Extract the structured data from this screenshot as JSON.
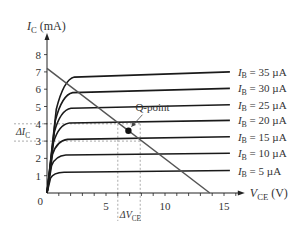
{
  "chart_data": {
    "type": "line",
    "title": "",
    "xlabel": "V",
    "xlabel_sub": "CE",
    "xlabel_unit": " (V)",
    "ylabel": "I",
    "ylabel_sub": "C",
    "ylabel_unit": " (mA)",
    "xlim": [
      0,
      16
    ],
    "ylim": [
      0,
      8.5
    ],
    "x_ticks": [
      5,
      10,
      15
    ],
    "x_minor_tick_step": 1,
    "y_ticks": [
      1,
      2,
      3,
      4,
      5,
      6,
      7,
      8
    ],
    "origin_label": "0",
    "grid": false,
    "series": [
      {
        "name": "I_B = 35 µA",
        "label_main": "I",
        "label_sub": "B",
        "label_rest": " = 35 µA",
        "sat": 6.7,
        "end": 7.0
      },
      {
        "name": "I_B = 30 µA",
        "label_main": "I",
        "label_sub": "B",
        "label_rest": " = 30 µA",
        "sat": 5.8,
        "end": 6.05
      },
      {
        "name": "I_B = 25 µA",
        "label_main": "I",
        "label_sub": "B",
        "label_rest": " = 25 µA",
        "sat": 4.9,
        "end": 5.1
      },
      {
        "name": "I_B = 20 µA",
        "label_main": "I",
        "label_sub": "B",
        "label_rest": " = 20 µA",
        "sat": 4.05,
        "end": 4.2
      },
      {
        "name": "I_B = 15 µA",
        "label_main": "I",
        "label_sub": "B",
        "label_rest": " = 15 µA",
        "sat": 3.1,
        "end": 3.25
      },
      {
        "name": "I_B = 10 µA",
        "label_main": "I",
        "label_sub": "B",
        "label_rest": " = 10 µA",
        "sat": 2.2,
        "end": 2.3
      },
      {
        "name": "I_B = 5 µA",
        "label_main": "I",
        "label_sub": "B",
        "label_rest": " = 5 µA",
        "sat": 1.2,
        "end": 1.3
      }
    ],
    "curve_x_end": 15.5,
    "load_line": {
      "x": [
        0,
        13.8
      ],
      "y": [
        7.2,
        0
      ]
    },
    "q_point": {
      "label": "Q-point",
      "x": 6.9,
      "y": 3.6
    },
    "delta_ic": {
      "label_main": "ΔI",
      "label_sub": "C",
      "y_low": 3.0,
      "y_high": 4.0
    },
    "delta_vce": {
      "label_main": "ΔV",
      "label_sub": "CE",
      "x_low": 6.0,
      "x_high": 7.9
    }
  }
}
